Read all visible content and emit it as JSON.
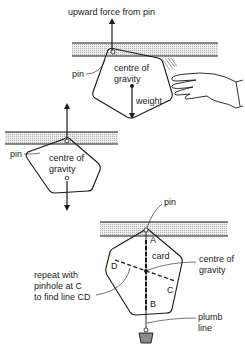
{
  "figure": {
    "panel1": {
      "title": "upward force from pin",
      "pin_label": "pin",
      "cog_label_line1": "centre of",
      "cog_label_line2": "gravity",
      "weight_label": "weight"
    },
    "panel2": {
      "pin_label": "pin",
      "cog_label_line1": "centre of",
      "cog_label_line2": "gravity"
    },
    "panel3": {
      "pin_label": "pin",
      "card_label": "card",
      "point_a": "A",
      "point_b": "B",
      "point_c": "C",
      "point_d": "D",
      "cog_label_line1": "centre of",
      "cog_label_line2": "gravity",
      "repeat_line1": "repeat with",
      "repeat_line2": "pinhole at C",
      "repeat_line3": "to find line CD",
      "plumb_line1": "plumb",
      "plumb_line2": "line"
    }
  },
  "colors": {
    "ink": "#1a1a1a",
    "bar_fill": "#d9d9d9",
    "weight_fill": "#8a8a8a"
  }
}
